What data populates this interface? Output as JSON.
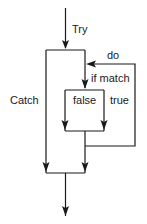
{
  "diagram": {
    "type": "flowchart",
    "title": "",
    "labels": {
      "try": "Try",
      "catch": "Catch",
      "do": "do",
      "if_match": "if match",
      "false": "false",
      "true": "true"
    },
    "colors": {
      "line": "#1a1a1a",
      "background": "#ffffff"
    },
    "nodes": [
      {
        "id": "entry",
        "label": "Try"
      },
      {
        "id": "outer-block",
        "label": ""
      },
      {
        "id": "match-test",
        "label": "if match"
      },
      {
        "id": "inner-block",
        "label": ""
      },
      {
        "id": "exit",
        "label": ""
      }
    ],
    "edges": [
      {
        "from": "entry",
        "to": "outer-block",
        "label": "Try"
      },
      {
        "from": "outer-block",
        "to": "exit",
        "label": "Catch"
      },
      {
        "from": "outer-block",
        "to": "match-test",
        "label": "if match"
      },
      {
        "from": "match-test",
        "to": "inner-block",
        "label": "false"
      },
      {
        "from": "match-test",
        "to": "inner-block",
        "label": "true"
      },
      {
        "from": "inner-block",
        "to": "match-test",
        "label": "do"
      },
      {
        "from": "inner-block",
        "to": "exit",
        "label": ""
      }
    ]
  }
}
